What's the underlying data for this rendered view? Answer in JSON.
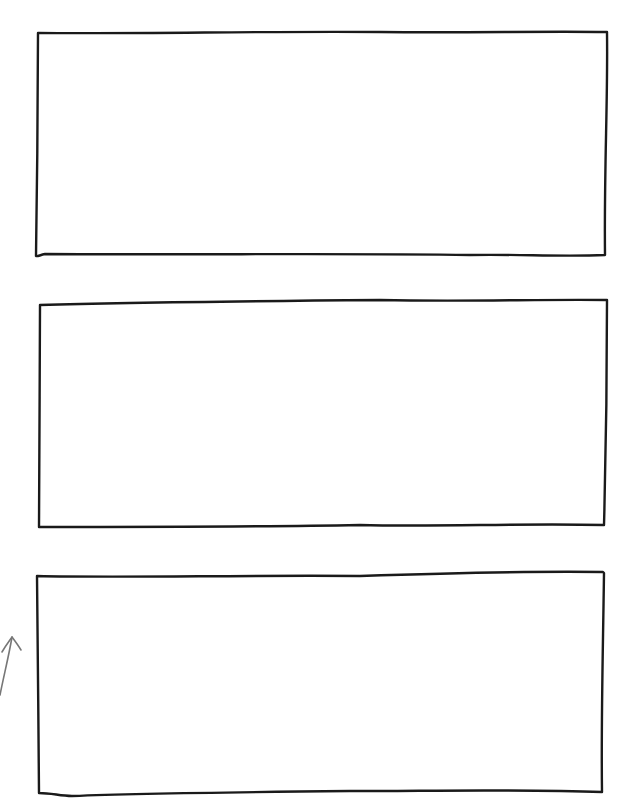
{
  "diagram": {
    "type": "hand-drawn wireframe",
    "background": "#ffffff",
    "stroke_color": "#1a1a1a",
    "arrow_color": "#777777",
    "boxes": [
      {
        "name": "box-1",
        "label": ""
      },
      {
        "name": "box-2",
        "label": ""
      },
      {
        "name": "box-3",
        "label": ""
      }
    ],
    "arrows": [
      {
        "name": "arrow-1",
        "direction": "up",
        "label": ""
      }
    ]
  }
}
